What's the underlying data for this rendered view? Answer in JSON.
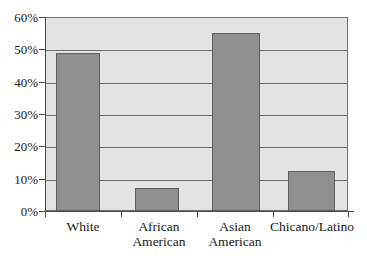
{
  "chart_data": {
    "type": "bar",
    "title": "",
    "subtitle": "",
    "xlabel": "",
    "ylabel": "",
    "categories": [
      "White",
      "African American",
      "Asian American",
      "Chicano/Latino"
    ],
    "category_lines": [
      [
        "White"
      ],
      [
        "African",
        "American"
      ],
      [
        "Asian",
        "American"
      ],
      [
        "Chicano/Latino"
      ]
    ],
    "values": [
      49,
      7,
      55,
      12.5
    ],
    "value_labels": [
      "49%",
      "7%",
      "55%",
      "12.5%"
    ],
    "ylim": [
      0,
      60
    ],
    "ytick_values": [
      0,
      10,
      20,
      30,
      40,
      50,
      60
    ],
    "ytick_labels": [
      "0%",
      "10%",
      "20%",
      "30%",
      "40%",
      "50%",
      "60%"
    ],
    "grid": true,
    "grid_axis": "y",
    "legend": false,
    "legend_position": "none",
    "series": [
      {
        "name": "",
        "values": [
          49,
          7,
          55,
          12.5
        ]
      }
    ]
  },
  "style": {
    "bar_fill": "#8f8f8f",
    "bar_stroke": "#5e5e5e",
    "plot_background": "#e3e3e3",
    "grid_color": "#6e6e6e",
    "axis_color": "#4a4a4a",
    "page_background": "#ffffff",
    "text_color": "#1a1a1a"
  }
}
